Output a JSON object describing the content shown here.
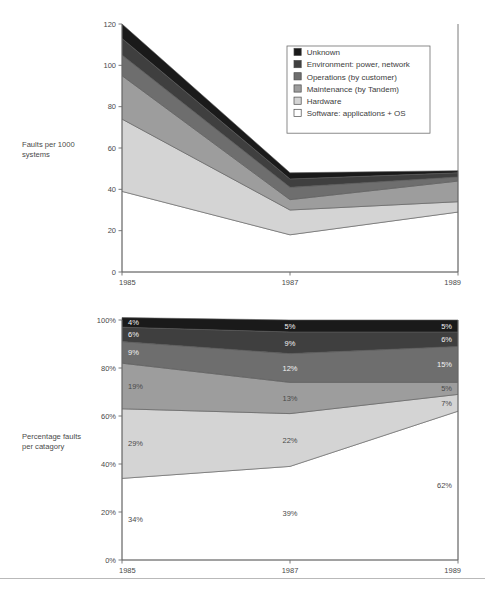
{
  "figure": {
    "background": "#ffffff",
    "rule_color": "#b9b9b9"
  },
  "palette": {
    "unknown": "#1a1a1a",
    "environment": "#3f3f3f",
    "operations": "#6e6e6e",
    "maintenance": "#9d9d9d",
    "hardware": "#d4d4d4",
    "software": "#ffffff",
    "axis": "#6b6b6b",
    "text": "#4a4a4a"
  },
  "legend": {
    "position": "top-right",
    "items": [
      {
        "label": "Unknown",
        "swatch": "#1a1a1a",
        "key": "unknown"
      },
      {
        "label": "Environment: power, network",
        "swatch": "#3f3f3f",
        "key": "environment"
      },
      {
        "label": "Operations (by customer)",
        "swatch": "#6e6e6e",
        "key": "operations"
      },
      {
        "label": "Maintenance (by Tandem)",
        "swatch": "#9d9d9d",
        "key": "maintenance"
      },
      {
        "label": "Hardware",
        "swatch": "#d4d4d4",
        "key": "hardware"
      },
      {
        "label": "Software: applications + OS",
        "swatch": "#ffffff",
        "key": "software"
      }
    ]
  },
  "chart_data": [
    {
      "id": "faults-per-1000-systems",
      "type": "area",
      "stacked": true,
      "title": "",
      "ylabel": "Faults per 1000 systems",
      "ylabel_lines": [
        "Faults per 1000",
        "systems"
      ],
      "xlabel": "",
      "x": [
        1985,
        1987,
        1989
      ],
      "xticklabels": [
        "1985",
        "1987",
        "1989"
      ],
      "ylim": [
        0,
        120
      ],
      "yticks": [
        0,
        20,
        40,
        60,
        80,
        100,
        120
      ],
      "yticklabels": [
        "0",
        "20",
        "40",
        "60",
        "80",
        "100",
        "120"
      ],
      "grid": false,
      "legend": true,
      "stack_order_bottom_up": [
        "software",
        "hardware",
        "maintenance",
        "operations",
        "environment",
        "unknown"
      ],
      "series": [
        {
          "name": "Software: applications + OS",
          "key": "software",
          "color": "#ffffff",
          "values": [
            39,
            18,
            29
          ]
        },
        {
          "name": "Hardware",
          "key": "hardware",
          "color": "#d4d4d4",
          "values": [
            35,
            12,
            5
          ]
        },
        {
          "name": "Maintenance (by Tandem)",
          "key": "maintenance",
          "color": "#9d9d9d",
          "values": [
            21,
            5,
            10
          ]
        },
        {
          "name": "Operations (by customer)",
          "key": "operations",
          "color": "#6e6e6e",
          "values": [
            10,
            6,
            2
          ]
        },
        {
          "name": "Environment: power, network",
          "key": "environment",
          "color": "#3f3f3f",
          "values": [
            8,
            4,
            2
          ]
        },
        {
          "name": "Unknown",
          "key": "unknown",
          "color": "#1a1a1a",
          "values": [
            7,
            3,
            1
          ]
        }
      ],
      "totals": [
        120,
        48,
        49
      ]
    },
    {
      "id": "percentage-faults-per-catagory",
      "type": "area",
      "stacked": true,
      "title": "",
      "ylabel": "Percentage faults per catagory",
      "ylabel_lines": [
        "Percentage faults",
        "per catagory"
      ],
      "xlabel": "",
      "x": [
        1985,
        1987,
        1989
      ],
      "xticklabels": [
        "1985",
        "1987",
        "1989"
      ],
      "ylim": [
        0,
        100
      ],
      "yticks": [
        0,
        20,
        40,
        60,
        80,
        100
      ],
      "yticklabels": [
        "0%",
        "20%",
        "40%",
        "60%",
        "80%",
        "100%"
      ],
      "grid": false,
      "legend": false,
      "stack_order_bottom_up": [
        "software",
        "hardware",
        "maintenance",
        "operations",
        "environment",
        "unknown"
      ],
      "series": [
        {
          "name": "Software: applications + OS",
          "key": "software",
          "color": "#ffffff",
          "values": [
            34,
            39,
            62
          ],
          "data_labels": [
            "34%",
            "39%",
            "62%"
          ]
        },
        {
          "name": "Hardware",
          "key": "hardware",
          "color": "#d4d4d4",
          "values": [
            29,
            22,
            7
          ],
          "data_labels": [
            "29%",
            "22%",
            "7%"
          ]
        },
        {
          "name": "Maintenance (by Tandem)",
          "key": "maintenance",
          "color": "#9d9d9d",
          "values": [
            19,
            13,
            5
          ],
          "data_labels": [
            "19%",
            "13%",
            "5%"
          ]
        },
        {
          "name": "Operations (by customer)",
          "key": "operations",
          "color": "#6e6e6e",
          "values": [
            9,
            12,
            15
          ],
          "data_labels": [
            "9%",
            "12%",
            "15%"
          ]
        },
        {
          "name": "Environment: power, network",
          "key": "environment",
          "color": "#3f3f3f",
          "values": [
            6,
            9,
            6
          ],
          "data_labels": [
            "6%",
            "9%",
            "6%"
          ]
        },
        {
          "name": "Unknown",
          "key": "unknown",
          "color": "#1a1a1a",
          "values": [
            4,
            5,
            5
          ],
          "data_labels": [
            "4%",
            "5%",
            "5%"
          ]
        }
      ],
      "totals": [
        100,
        100,
        100
      ]
    }
  ]
}
